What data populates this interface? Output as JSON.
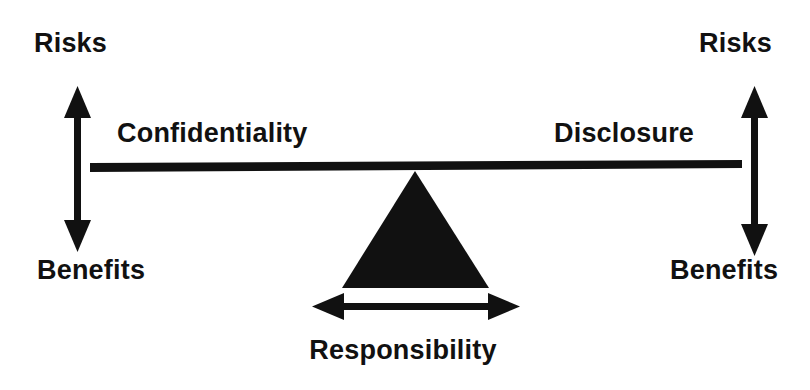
{
  "diagram": {
    "type": "balance-scale-seesaw",
    "background_color": "#ffffff",
    "ink_color": "#111111",
    "title_visible": false,
    "labels": {
      "risks_left": "Risks",
      "risks_right": "Risks",
      "benefits_left": "Benefits",
      "benefits_right": "Benefits",
      "left_pan": "Confidentiality",
      "right_pan": "Disclosure",
      "fulcrum": "Responsibility"
    },
    "elements": {
      "beam": "balance-beam",
      "fulcrum": "triangle-fulcrum",
      "left_axis": "vertical-double-arrow-left",
      "right_axis": "vertical-double-arrow-right",
      "base_axis": "horizontal-double-arrow"
    }
  }
}
